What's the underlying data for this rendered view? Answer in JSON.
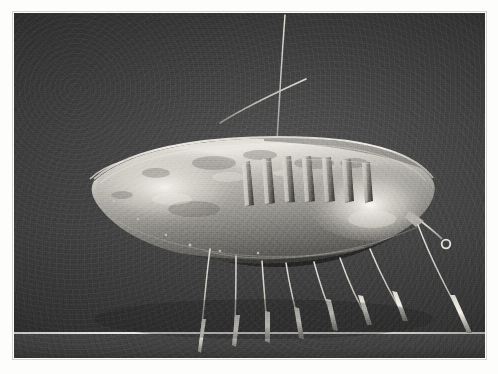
{
  "image": {
    "medium": "black-and-white photograph",
    "subject": "metal boat-shaped sculpture",
    "caption": "",
    "background_color": "#3d3d3d",
    "border_color": "#fdfdfc",
    "highlight_color": "#efece4",
    "shadow_color": "#1e1e1e"
  },
  "print": {
    "left": 14,
    "top": 13,
    "width": 471,
    "height": 345
  },
  "scene": {
    "horizon_line_y": 332,
    "floor_band_top": 334
  },
  "sculpture": {
    "name": "boat-form-sculpture",
    "hull": {
      "label": "hull",
      "prow_x": 80,
      "stern_x": 418,
      "rim_y": 132,
      "keel_y": 243
    },
    "mast": {
      "label": "mast",
      "top_x": 270,
      "top_y": 14,
      "base_x": 262,
      "base_y": 143
    },
    "spar": {
      "label": "spar",
      "left_x": 212,
      "left_y": 104,
      "right_x": 288,
      "right_y": 69
    },
    "ribs_count": 7,
    "legs_count": 8,
    "stern_ring": {
      "label": "stern-ring",
      "x": 432,
      "y": 233
    }
  }
}
